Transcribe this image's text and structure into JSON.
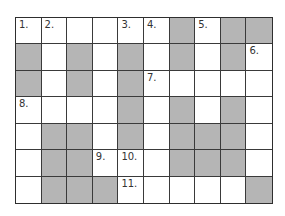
{
  "puzzle": {
    "rows": 7,
    "cols": 10,
    "colors": {
      "block": "#b5b5b5",
      "open": "#ffffff",
      "line": "#3a3a3a"
    },
    "grid": [
      [
        "W",
        "W",
        "W",
        "W",
        "W",
        "W",
        "B",
        "W",
        "B",
        "B"
      ],
      [
        "B",
        "W",
        "B",
        "W",
        "B",
        "W",
        "B",
        "W",
        "B",
        "W"
      ],
      [
        "B",
        "W",
        "B",
        "W",
        "B",
        "W",
        "W",
        "W",
        "W",
        "W"
      ],
      [
        "W",
        "W",
        "W",
        "W",
        "B",
        "W",
        "B",
        "W",
        "B",
        "W"
      ],
      [
        "W",
        "B",
        "B",
        "W",
        "B",
        "W",
        "B",
        "B",
        "B",
        "W"
      ],
      [
        "W",
        "B",
        "B",
        "W",
        "W",
        "W",
        "B",
        "B",
        "B",
        "W"
      ],
      [
        "W",
        "B",
        "B",
        "B",
        "W",
        "W",
        "W",
        "W",
        "W",
        "B"
      ]
    ],
    "numbers": [
      {
        "row": 0,
        "col": 0,
        "label": "1."
      },
      {
        "row": 0,
        "col": 1,
        "label": "2."
      },
      {
        "row": 0,
        "col": 4,
        "label": "3."
      },
      {
        "row": 0,
        "col": 5,
        "label": "4."
      },
      {
        "row": 0,
        "col": 7,
        "label": "5."
      },
      {
        "row": 1,
        "col": 9,
        "label": "6."
      },
      {
        "row": 2,
        "col": 5,
        "label": "7."
      },
      {
        "row": 3,
        "col": 0,
        "label": "8."
      },
      {
        "row": 5,
        "col": 3,
        "label": "9."
      },
      {
        "row": 5,
        "col": 4,
        "label": "10."
      },
      {
        "row": 6,
        "col": 4,
        "label": "11."
      }
    ]
  }
}
